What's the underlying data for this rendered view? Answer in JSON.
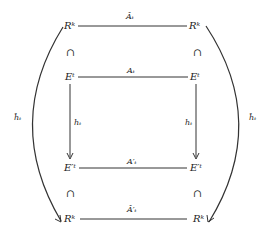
{
  "diagram": {
    "type": "commutative-diagram",
    "nodes": {
      "top_left": "Rᵏ",
      "top_right": "Rᵏ",
      "mid_top_left": "Eᵗ",
      "mid_top_right": "Eᵗ",
      "mid_bottom_left": "E′ᵗ",
      "mid_bottom_right": "E′ᵗ",
      "bottom_left": "Rᵏ",
      "bottom_right": "Rᵏ"
    },
    "edges": {
      "top": "Âₜ",
      "middle_top": "Aₜ",
      "left_vertical": "hₜ",
      "right_vertical": "hₜ",
      "middle_bottom": "A′ₜ",
      "bottom": "Â′ₜ",
      "left_arc": "ĥₜ",
      "right_arc": "ĥₜ"
    },
    "inclusion_symbol": "⊂"
  }
}
